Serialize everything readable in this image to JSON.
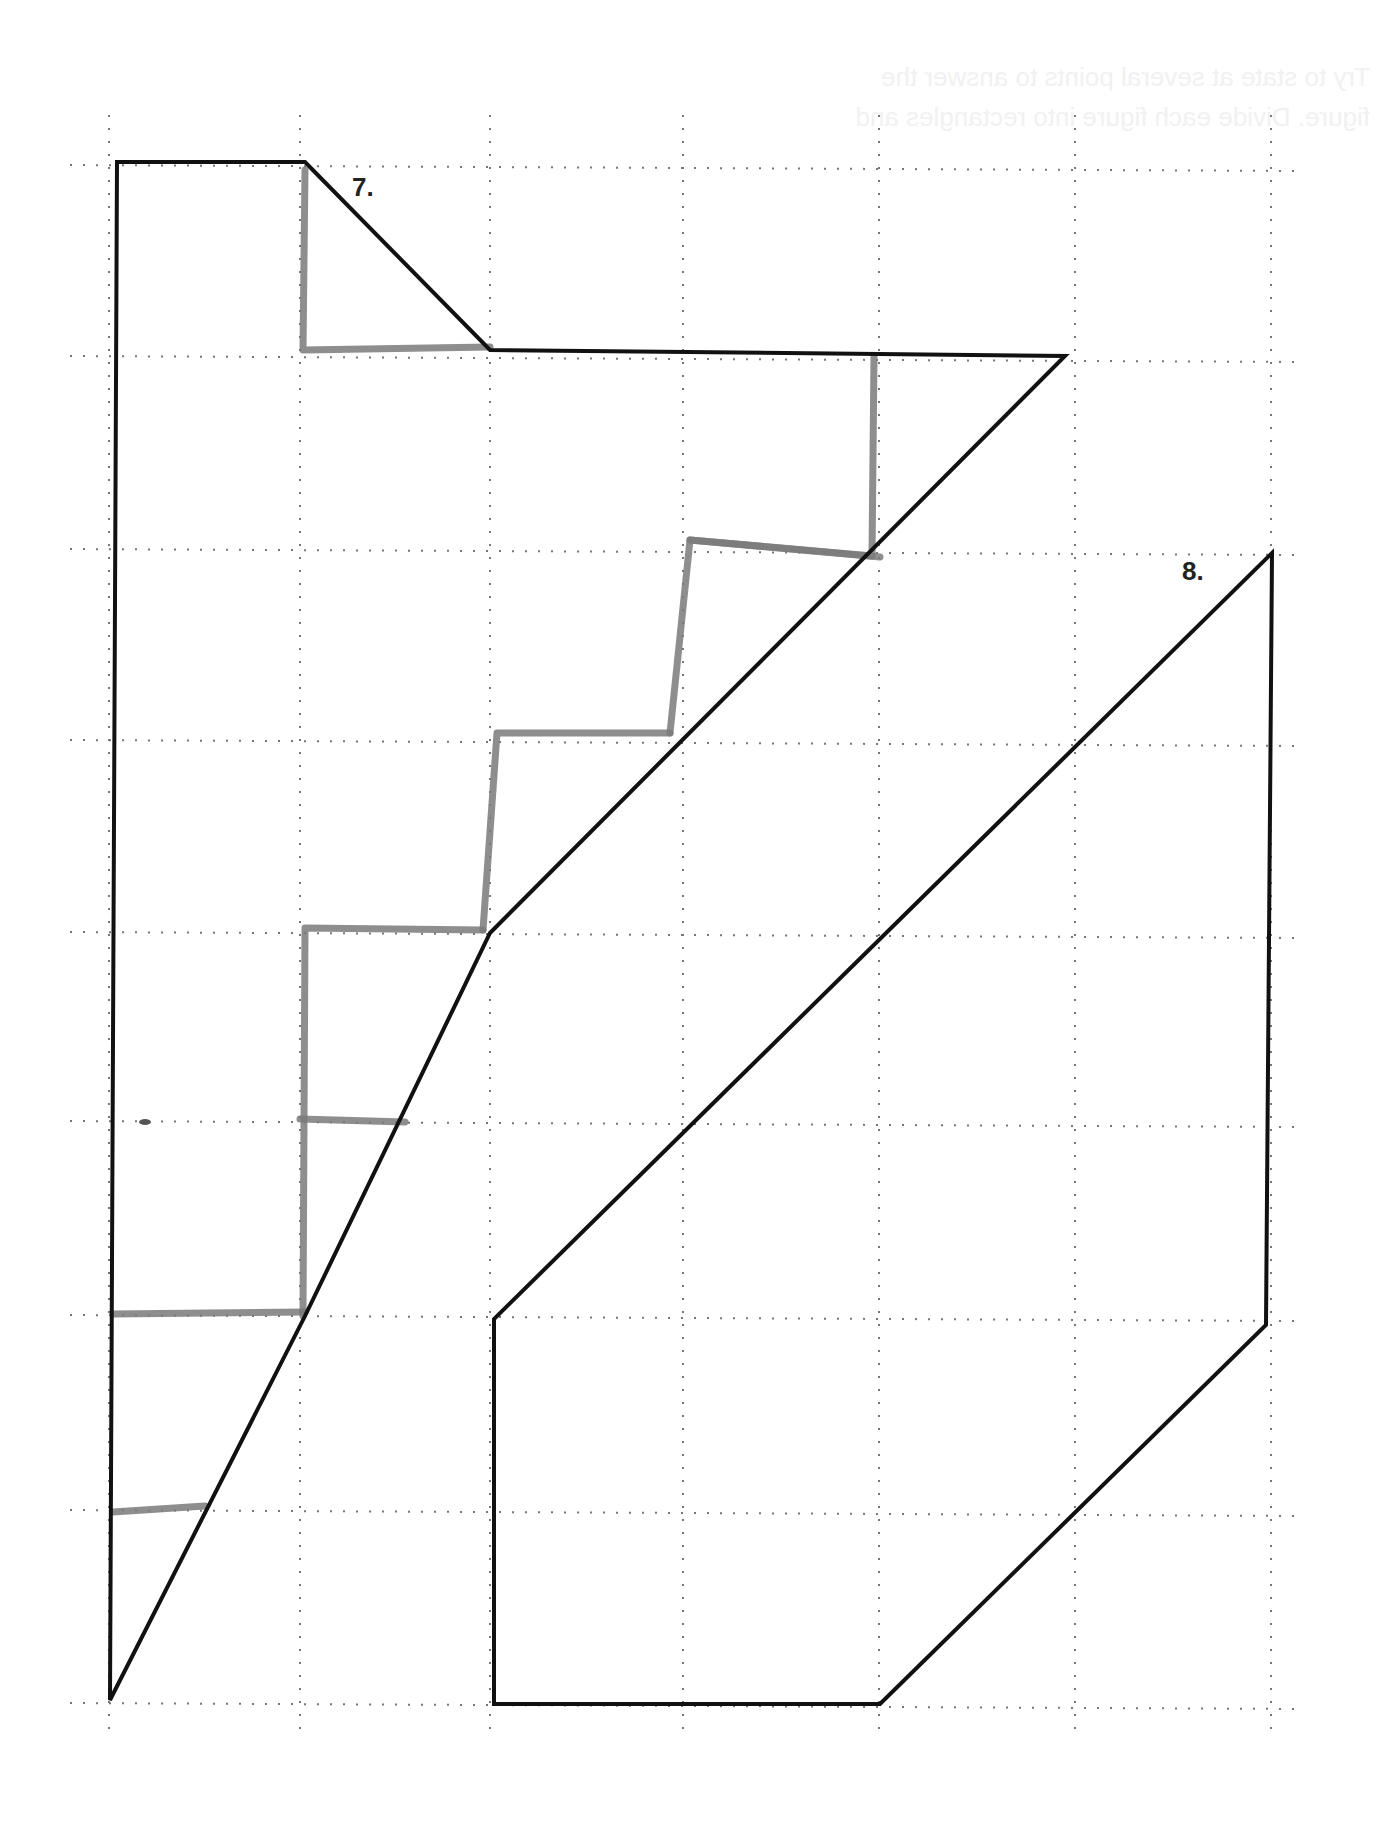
{
  "page": {
    "background": "#ffffff",
    "bleed_through_text": [
      "Try to state at several points to answer the",
      "figure. Divide each figure into rectangles and"
    ]
  },
  "grid": {
    "style": "dotted",
    "color": "#777777",
    "columns_x": [
      109,
      300,
      490,
      683,
      879,
      1075,
      1271
    ],
    "rows_y": [
      165,
      356,
      549,
      740,
      932,
      1121,
      1315,
      1510,
      1703
    ],
    "extent": {
      "x_min": 70,
      "x_max": 1300,
      "y_min": 115,
      "y_max": 1735
    }
  },
  "figures": [
    {
      "label": "7.",
      "label_pos": [
        352,
        196
      ],
      "outline_color": "#111111",
      "outline": [
        [
          117,
          162
        ],
        [
          305,
          162
        ],
        [
          490,
          350
        ],
        [
          1065,
          356
        ],
        [
          490,
          933
        ],
        [
          305,
          1316
        ],
        [
          110,
          1700
        ]
      ],
      "closing_edge": [
        [
          110,
          1700
        ],
        [
          117,
          162
        ]
      ],
      "marker_color": "#7a7a7a",
      "marker_strokes": [
        [
          [
            305,
            170
          ],
          [
            303,
            350
          ],
          [
            490,
            347
          ]
        ],
        [
          [
            874,
            356
          ],
          [
            872,
            556
          ],
          [
            690,
            540
          ],
          [
            670,
            733
          ]
        ],
        [
          [
            690,
            540
          ],
          [
            880,
            557
          ]
        ],
        [
          [
            670,
            733
          ],
          [
            497,
            733
          ],
          [
            483,
            930
          ]
        ],
        [
          [
            483,
            930
          ],
          [
            305,
            928
          ],
          [
            303,
            1316
          ]
        ],
        [
          [
            300,
            1119
          ],
          [
            405,
            1122
          ]
        ],
        [
          [
            113,
            1314
          ],
          [
            305,
            1312
          ]
        ],
        [
          [
            113,
            1512
          ],
          [
            205,
            1506
          ]
        ]
      ],
      "stray_mark": [
        145,
        1122
      ]
    },
    {
      "label": "8.",
      "label_pos": [
        1182,
        580
      ],
      "outline_color": "#111111",
      "outline": [
        [
          1272,
          553
        ],
        [
          1266,
          1325
        ],
        [
          880,
          1704
        ],
        [
          494,
          1704
        ],
        [
          494,
          1319
        ],
        [
          1272,
          553
        ]
      ]
    }
  ]
}
